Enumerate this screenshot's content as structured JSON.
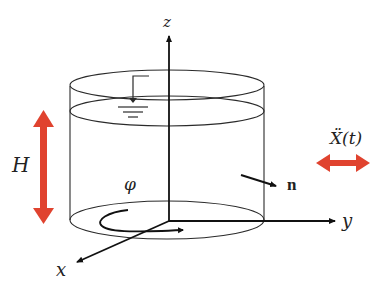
{
  "diagram": {
    "type": "cylindrical-tank-schematic",
    "colors": {
      "line": "#2a2a2a",
      "axis": "#111111",
      "accent": "#e0432f",
      "background": "#ffffff"
    },
    "labels": {
      "z_axis": "z",
      "y_axis": "y",
      "x_axis": "x",
      "height": "H",
      "angle": "φ",
      "normal": "n",
      "excitation": "Ẍ(t)"
    },
    "elements": [
      {
        "id": "tank",
        "shape": "cylinder",
        "description": "open cylindrical tank"
      },
      {
        "id": "free-surface",
        "shape": "ellipse",
        "description": "liquid free surface with water-level symbol"
      },
      {
        "id": "z-axis",
        "label": "z"
      },
      {
        "id": "y-axis",
        "label": "y"
      },
      {
        "id": "x-axis",
        "label": "x"
      },
      {
        "id": "height-arrow",
        "label": "H",
        "color": "#e0432f"
      },
      {
        "id": "excitation-arrow",
        "label": "Ẍ(t)",
        "color": "#e0432f"
      },
      {
        "id": "normal-vector",
        "label": "n"
      },
      {
        "id": "angle-arc",
        "label": "φ"
      }
    ]
  }
}
